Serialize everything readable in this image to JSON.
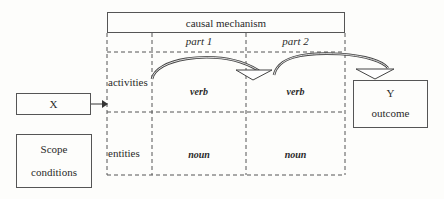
{
  "diagram": {
    "mechanism_title": "causal mechanism",
    "columns": [
      {
        "label": "part 1"
      },
      {
        "label": "part 2"
      }
    ],
    "rows": [
      {
        "label": "activities",
        "cells": [
          "verb",
          "verb"
        ]
      },
      {
        "label": "entities",
        "cells": [
          "noun",
          "noun"
        ]
      }
    ],
    "cause": {
      "label": "X"
    },
    "scope": {
      "line1": "Scope",
      "line2": "conditions"
    },
    "outcome": {
      "line1": "Y",
      "line2": "outcome"
    }
  }
}
